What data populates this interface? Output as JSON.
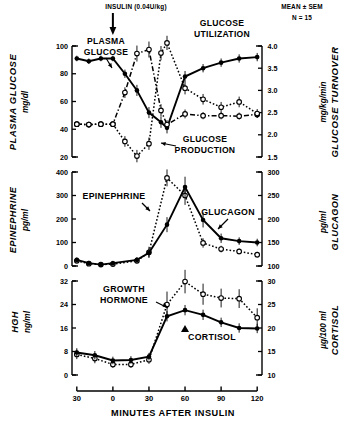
{
  "figure": {
    "annotation_insulin": "INSULIN (0.04U/kg)",
    "annotation_mean": "MEAN ± SEM",
    "annotation_n": "N = 15",
    "xlabel": "MINUTES  AFTER  INSULIN",
    "arrow_icon": "down-arrow-icon"
  },
  "chart_data": [
    {
      "type": "line",
      "panel": "top",
      "title": "",
      "xlabel": "MINUTES AFTER INSULIN",
      "x": [
        -30,
        -20,
        -10,
        0,
        10,
        20,
        30,
        40,
        45,
        60,
        75,
        90,
        105,
        120
      ],
      "xlim": [
        -34,
        124
      ],
      "xticks": [
        -30,
        0,
        30,
        60,
        90,
        120
      ],
      "xticklabels": [
        "30",
        "0",
        "30",
        "60",
        "90",
        "120"
      ],
      "ylabel_left": "PLASMA  GLUCOSE",
      "yunit_left": "mg/dl",
      "ylim_left": [
        20,
        100
      ],
      "yticks_left": [
        20,
        40,
        60,
        80,
        100
      ],
      "ylabel_right": "GLUCOSE  TURNOVER",
      "yunit_right": "mg/kg/min",
      "ylim_right": [
        1.5,
        4.0
      ],
      "yticks_right": [
        1.5,
        2.0,
        2.5,
        3.0,
        3.5,
        4.0
      ],
      "grid": false,
      "legend": "inline-annotations",
      "series": [
        {
          "name": "PLASMA GLUCOSE",
          "axis": "left",
          "marker": "filled-circle",
          "linestyle": "solid",
          "label_pos": {
            "x": 4,
            "y": 112
          },
          "x": [
            -30,
            -20,
            -10,
            0,
            10,
            20,
            30,
            40,
            45,
            60,
            75,
            90,
            105,
            120
          ],
          "values": [
            91,
            89,
            91,
            91,
            80,
            68,
            52,
            45,
            41,
            78,
            84,
            88,
            91,
            92
          ],
          "err": [
            2,
            2,
            2,
            2,
            3,
            4,
            4,
            4,
            4,
            4,
            3,
            3,
            3,
            3
          ]
        },
        {
          "name": "GLUCOSE PRODUCTION",
          "axis": "right",
          "marker": "open-circle",
          "linestyle": "dash-dot",
          "label_pos": {
            "x": 52,
            "y": 30
          },
          "x": [
            -30,
            -20,
            -10,
            0,
            10,
            20,
            30,
            40,
            45,
            60,
            75,
            90,
            105,
            120
          ],
          "values": [
            2.24,
            2.23,
            2.24,
            2.24,
            2.95,
            3.83,
            3.92,
            2.55,
            2.23,
            2.47,
            2.43,
            2.43,
            2.42,
            2.46
          ],
          "err": [
            0.06,
            0.06,
            0.06,
            0.06,
            0.12,
            0.18,
            0.18,
            0.14,
            0.1,
            0.1,
            0.08,
            0.08,
            0.08,
            0.08
          ]
        },
        {
          "name": "GLUCOSE UTILIZATION",
          "axis": "right",
          "marker": "open-circle",
          "linestyle": "dotted",
          "label_pos": {
            "x": 62,
            "y": 116
          },
          "x": [
            -30,
            -20,
            -10,
            0,
            10,
            20,
            30,
            40,
            45,
            60,
            75,
            90,
            105,
            120
          ],
          "values": [
            2.24,
            2.23,
            2.24,
            2.24,
            1.85,
            1.52,
            1.8,
            3.84,
            4.07,
            3.05,
            2.8,
            2.62,
            2.74,
            2.48
          ],
          "err": [
            0.06,
            0.06,
            0.06,
            0.06,
            0.12,
            0.14,
            0.14,
            0.16,
            0.16,
            0.14,
            0.12,
            0.12,
            0.12,
            0.1
          ]
        }
      ]
    },
    {
      "type": "line",
      "panel": "middle",
      "x": [
        -30,
        -20,
        -10,
        0,
        10,
        20,
        30,
        40,
        45,
        60,
        75,
        90,
        105,
        120
      ],
      "xlim": [
        -34,
        124
      ],
      "xticks": [
        -30,
        0,
        30,
        60,
        90,
        120
      ],
      "ylabel_left": "EPINEPHRINE",
      "yunit_left": "pg/ml",
      "ylim_left": [
        0,
        400
      ],
      "yticks_left": [
        0,
        100,
        200,
        300,
        400
      ],
      "ylabel_right": "GLUCAGON",
      "yunit_right": "pg/ml",
      "ylim_right": [
        100,
        300
      ],
      "yticks_right": [
        100,
        150,
        200,
        250,
        300
      ],
      "grid": false,
      "series": [
        {
          "name": "EPINEPHRINE",
          "axis": "left",
          "marker": "open-circle",
          "linestyle": "dotted",
          "label_pos": {
            "x": -14,
            "y": 300
          },
          "x": [
            -30,
            -20,
            -10,
            0,
            20,
            30,
            45,
            60,
            75,
            90,
            105,
            120
          ],
          "values": [
            22,
            10,
            6,
            8,
            22,
            58,
            375,
            300,
            98,
            72,
            62,
            48
          ],
          "err": [
            8,
            8,
            6,
            6,
            10,
            24,
            36,
            40,
            20,
            14,
            12,
            12
          ]
        },
        {
          "name": "GLUCAGON",
          "axis": "right",
          "marker": "filled-circle",
          "linestyle": "solid",
          "label_pos": {
            "x": 62,
            "y": 205
          },
          "x": [
            -30,
            -20,
            -10,
            0,
            20,
            30,
            45,
            60,
            75,
            90,
            105,
            120
          ],
          "values": [
            113,
            106,
            103,
            106,
            113,
            128,
            188,
            268,
            198,
            159,
            153,
            150
          ],
          "err": [
            5,
            5,
            5,
            5,
            6,
            9,
            16,
            22,
            16,
            10,
            8,
            8
          ]
        }
      ]
    },
    {
      "type": "line",
      "panel": "bottom",
      "x": [
        -30,
        -20,
        -10,
        0,
        10,
        20,
        30,
        45,
        60,
        75,
        90,
        105,
        120
      ],
      "xlim": [
        -34,
        124
      ],
      "xticks": [
        -30,
        0,
        30,
        60,
        90,
        120
      ],
      "ylabel_left": "HGH",
      "yunit_left": "ng/ml",
      "ylim_left": [
        0,
        32
      ],
      "yticks_left": [
        0,
        8,
        16,
        24,
        32
      ],
      "ylabel_right": "CORTISOL",
      "yunit_right": "µg/100 ml",
      "ylim_right": [
        10,
        30
      ],
      "yticks_right": [
        10,
        15,
        20,
        25,
        30
      ],
      "grid": false,
      "series": [
        {
          "name": "GROWTH HORMONE",
          "axis": "left",
          "marker": "open-circle",
          "linestyle": "dotted",
          "label_pos": {
            "x": -8,
            "y": 27
          },
          "x": [
            -30,
            -15,
            0,
            15,
            30,
            45,
            60,
            75,
            90,
            105,
            120
          ],
          "values": [
            7.0,
            5.6,
            3.6,
            3.6,
            5.2,
            24.0,
            31.8,
            27.5,
            26.2,
            26.0,
            19.5
          ],
          "err": [
            1.6,
            1.6,
            1.2,
            1.2,
            1.4,
            4.4,
            4.0,
            3.6,
            3.2,
            3.2,
            3.2
          ]
        },
        {
          "name": "CORTISOL",
          "axis": "right",
          "marker": "filled-circle",
          "linestyle": "solid",
          "label_pos": {
            "x": 62,
            "y": 13.3
          },
          "x": [
            -30,
            -15,
            0,
            15,
            30,
            45,
            60,
            75,
            90,
            105,
            120
          ],
          "values": [
            14.8,
            14.2,
            13.1,
            13.2,
            13.9,
            22.5,
            23.8,
            22.8,
            21.2,
            20.0,
            19.9
          ],
          "err": [
            0.9,
            0.9,
            0.8,
            0.8,
            0.8,
            1.1,
            1.1,
            1.1,
            1.0,
            1.0,
            1.0
          ]
        }
      ]
    }
  ]
}
